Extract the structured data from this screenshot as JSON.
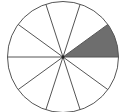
{
  "diagram": {
    "type": "fraction-circle",
    "total_sectors": 10,
    "shaded_sectors": [
      0
    ],
    "fraction_shaded": "1/10",
    "center": [
      63,
      57
    ],
    "radius": 55.5,
    "start_angle_deg": 0,
    "colors": {
      "stroke": "#555555",
      "shade": "#6e6e6e",
      "background": "#ffffff",
      "center_dot": "#222222"
    }
  }
}
